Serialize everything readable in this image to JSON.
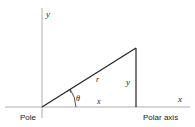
{
  "diagram": {
    "labels": {
      "y_axis": "y",
      "x_axis": "x",
      "radius": "r",
      "opposite_side": "y",
      "adjacent_side": "x",
      "angle": "θ",
      "pole": "Pole",
      "polar_axis": "Polar axis"
    },
    "colors": {
      "line": "#222222",
      "axis": "#999999",
      "background": "#ffffff"
    },
    "geometry": {
      "origin": [
        42,
        107
      ],
      "apex": [
        136,
        48
      ],
      "foot": [
        136,
        107
      ]
    }
  }
}
